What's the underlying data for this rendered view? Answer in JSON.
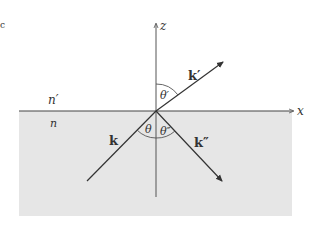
{
  "figure": {
    "colors": {
      "background": "#ffffff",
      "lower_medium_fill": "#e6e6e6",
      "line": "#333333"
    },
    "axes": {
      "x_label": "x",
      "z_label": "z"
    },
    "media": {
      "upper_label": "n′",
      "lower_label": "n"
    },
    "vectors": {
      "incident_label": "k",
      "transmitted_label": "k′",
      "reflected_label": "k″"
    },
    "angles": {
      "incident_label": "θ",
      "transmitted_label": "θ′",
      "reflected_label": "θ″"
    },
    "corner_mark": "c"
  }
}
